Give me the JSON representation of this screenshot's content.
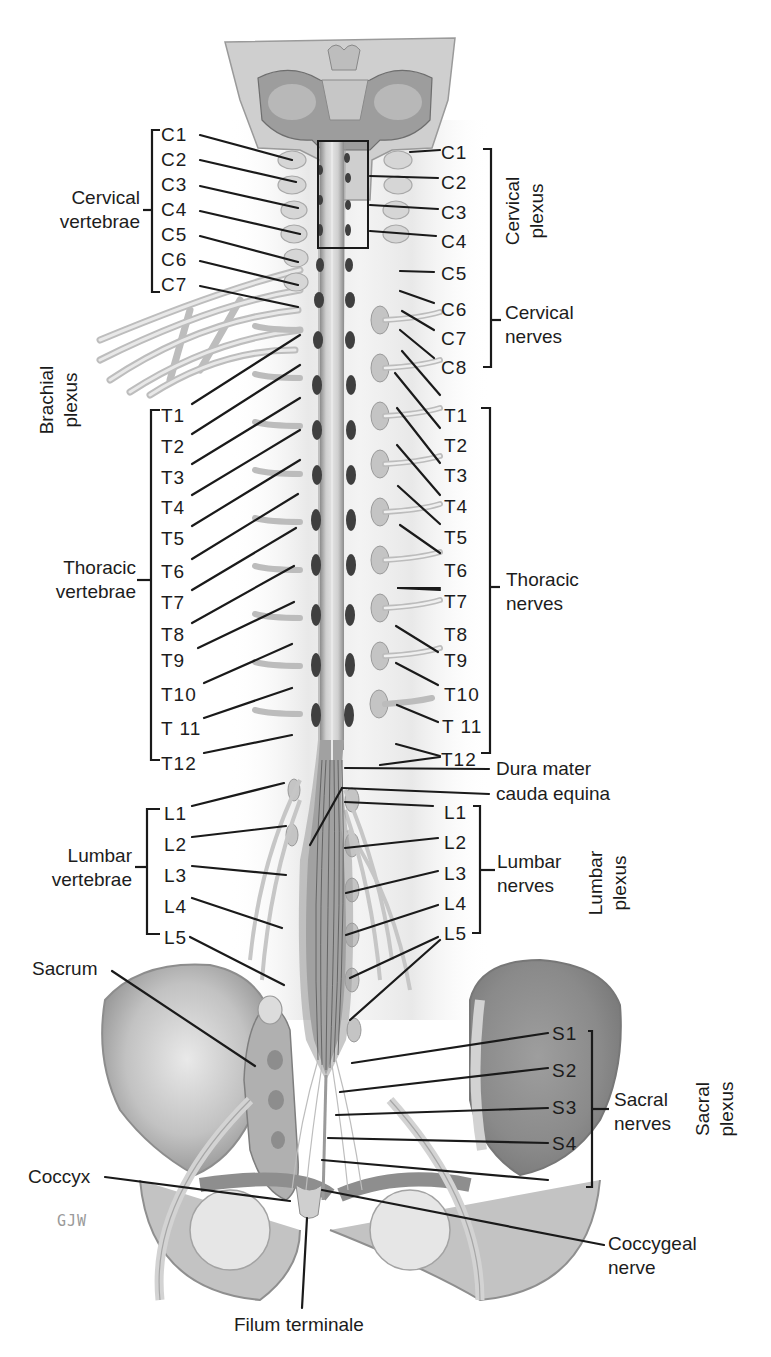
{
  "figure": {
    "signature": "GJW"
  },
  "left_labels": {
    "cervical": [
      "C1",
      "C2",
      "C3",
      "C4",
      "C5",
      "C6",
      "C7"
    ],
    "thoracic": [
      "T1",
      "T2",
      "T3",
      "T4",
      "T5",
      "T6",
      "T7",
      "T8",
      "T9",
      "T10",
      "T 11",
      "T12"
    ],
    "lumbar": [
      "L1",
      "L2",
      "L3",
      "L4",
      "L5"
    ]
  },
  "right_labels": {
    "cervical": [
      "C1",
      "C2",
      "C3",
      "C4",
      "C5",
      "C6",
      "C7",
      "C8"
    ],
    "thoracic": [
      "T1",
      "T2",
      "T3",
      "T4",
      "T5",
      "T6",
      "T7",
      "T8",
      "T9",
      "T10",
      "T 11",
      "T12"
    ],
    "lumbar": [
      "L1",
      "L2",
      "L3",
      "L4",
      "L5"
    ],
    "sacral": [
      "S1",
      "S2",
      "S3",
      "S4"
    ]
  },
  "groups": {
    "cervical_vertebrae": [
      "Cervical",
      "vertebrae"
    ],
    "brachial_plexus": [
      "Brachial",
      "plexus"
    ],
    "thoracic_vertebrae": [
      "Thoracic",
      "vertebrae"
    ],
    "lumbar_vertebrae": [
      "Lumbar",
      "vertebrae"
    ],
    "cervical_plexus": [
      "Cervical",
      "plexus"
    ],
    "cervical_nerves": [
      "Cervical",
      "nerves"
    ],
    "thoracic_nerves": [
      "Thoracic",
      "nerves"
    ],
    "lumbar_nerves": [
      "Lumbar",
      "nerves"
    ],
    "lumbar_plexus": [
      "Lumbar",
      "plexus"
    ],
    "sacral_nerves": [
      "Sacral",
      "nerves"
    ],
    "sacral_plexus": [
      "Sacral",
      "plexus"
    ]
  },
  "structures": {
    "dura_mater": "Dura mater",
    "cauda_equina": "cauda equina",
    "sacrum": "Sacrum",
    "coccyx": "Coccyx",
    "coccygeal_nerve": [
      "Coccygeal",
      "nerve"
    ],
    "filum_terminale": "Filum terminale"
  },
  "colors": {
    "ink": "#1a1a1a",
    "bone_light": "#d9d9d9",
    "bone_mid": "#b5b5b5",
    "bone_dark": "#8a8a8a",
    "cord": "#c9c9c9",
    "ganglion_dark": "#3a3a3a"
  }
}
